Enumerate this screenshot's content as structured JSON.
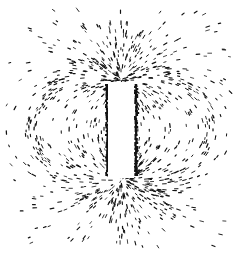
{
  "image": {
    "subject": "Iron filings pattern around a bar magnet",
    "description": "Black iron filings on white background forming magnetic field lines around a vertical bar magnet",
    "colors": {
      "background": "#ffffff",
      "filings": "#111111",
      "magnet": "#ffffff"
    }
  }
}
